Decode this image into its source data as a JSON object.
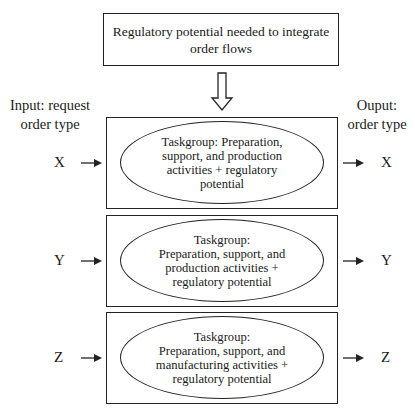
{
  "header": {
    "text_line1": "Regulatory potential needed to integrate",
    "text_line2": "order flows"
  },
  "labels": {
    "input_line1": "Input: request",
    "input_line2": "order type",
    "output_line1": "Ouput:",
    "output_line2": "order type"
  },
  "rows": [
    {
      "input": "X",
      "output": "X",
      "lines": [
        "Taskgroup: Preparation,",
        "support, and production",
        "activities + regulatory",
        "potential"
      ]
    },
    {
      "input": "Y",
      "output": "Y",
      "lines": [
        "Taskgroup:",
        "Preparation, support, and",
        "production activities +",
        "regulatory potential"
      ]
    },
    {
      "input": "Z",
      "output": "Z",
      "lines": [
        "Taskgroup:",
        "Preparation, support, and",
        "manufacturing activities +",
        "regulatory potential"
      ]
    }
  ],
  "colors": {
    "stroke": "#222222",
    "background": "#ffffff"
  }
}
